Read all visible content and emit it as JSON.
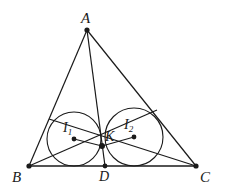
{
  "figure": {
    "background_color": "#ffffff",
    "stroke_color": "#1a1a1a",
    "label_color": "#1a1a1a",
    "canvas": {
      "width": 226,
      "height": 196
    }
  },
  "labels": {
    "A": "A",
    "B": "B",
    "C": "C",
    "D": "D",
    "K": "K",
    "I1_base": "I",
    "I1_sub": "1",
    "I2_base": "I",
    "I2_sub": "2"
  },
  "geometry": {
    "points": {
      "A": {
        "x": 87,
        "y": 30,
        "label": "A"
      },
      "B": {
        "x": 29,
        "y": 166,
        "label": "B"
      },
      "C": {
        "x": 196,
        "y": 166,
        "label": "C"
      },
      "D": {
        "x": 105,
        "y": 166,
        "label": "D"
      },
      "K": {
        "x": 102,
        "y": 146,
        "label": "K"
      },
      "I1": {
        "x": 74,
        "y": 139,
        "label": "I1"
      },
      "I2": {
        "x": 134,
        "y": 137,
        "label": "I2"
      },
      "E": {
        "x": 157,
        "y": 110,
        "label": ""
      },
      "F": {
        "x": 49,
        "y": 119,
        "label": ""
      }
    },
    "segments": [
      {
        "name": "side-AB",
        "from": "A",
        "to": "B"
      },
      {
        "name": "side-AC",
        "from": "A",
        "to": "C"
      },
      {
        "name": "side-BC",
        "from": "B",
        "to": "C"
      },
      {
        "name": "cevian-AD",
        "from": "A",
        "to": "D"
      },
      {
        "name": "cevian-BE",
        "from": "B",
        "to": "E"
      },
      {
        "name": "cevian-CF",
        "from": "C",
        "to": "F"
      },
      {
        "name": "radius-I1-K",
        "from": "I1",
        "to": "K"
      },
      {
        "name": "radius-K-I2",
        "from": "K",
        "to": "I2"
      }
    ],
    "circles": [
      {
        "name": "incircle-ABD",
        "cx": 74,
        "cy": 139,
        "r": 27
      },
      {
        "name": "incircle-ACD",
        "cx": 134,
        "cy": 137,
        "r": 29
      }
    ],
    "dots": [
      "A",
      "B",
      "C",
      "D",
      "K",
      "I1",
      "I2"
    ]
  },
  "label_positions": {
    "A": {
      "x": 81,
      "y": 11
    },
    "B": {
      "x": 12,
      "y": 170
    },
    "C": {
      "x": 200,
      "y": 170
    },
    "D": {
      "x": 99,
      "y": 170
    },
    "K": {
      "x": 105,
      "y": 130
    },
    "I1": {
      "x": 63,
      "y": 122
    },
    "I2": {
      "x": 124,
      "y": 119
    }
  }
}
